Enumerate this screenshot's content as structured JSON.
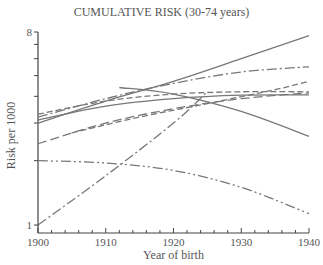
{
  "chart_data": {
    "type": "line",
    "title": "CUMULATIVE RISK (30-74 years)",
    "xlabel": "Year of birth",
    "ylabel": "Risk per 1000",
    "xlim": [
      1900,
      1940
    ],
    "ylim": [
      1,
      8
    ],
    "yscale": "log",
    "x_ticks": [
      1900,
      1910,
      1920,
      1930,
      1940
    ],
    "y_tick_labels": [
      "1",
      "8"
    ],
    "grid": false,
    "legend": "none",
    "series": [
      {
        "name": "solid-rising-top",
        "style": "solid",
        "x": [
          1900,
          1910,
          1920,
          1930,
          1940
        ],
        "values": [
          3.0,
          3.8,
          4.7,
          6.0,
          7.7
        ]
      },
      {
        "name": "dashdot-rising",
        "style": "dashdot",
        "x": [
          1900,
          1910,
          1920,
          1930,
          1940
        ],
        "values": [
          3.2,
          3.9,
          4.6,
          5.2,
          5.5
        ]
      },
      {
        "name": "dashed-rising",
        "style": "dashed",
        "x": [
          1905,
          1915,
          1925,
          1935,
          1940
        ],
        "values": [
          2.7,
          3.2,
          3.7,
          4.3,
          4.7
        ]
      },
      {
        "name": "long-dashed-rising",
        "style": "longdash",
        "x": [
          1900,
          1910,
          1920,
          1930,
          1940
        ],
        "values": [
          2.4,
          3.0,
          3.5,
          3.9,
          4.15
        ]
      },
      {
        "name": "solid-curve-flat",
        "style": "solid",
        "x": [
          1900,
          1910,
          1920,
          1930,
          1940
        ],
        "values": [
          3.1,
          3.6,
          3.9,
          4.05,
          4.06
        ]
      },
      {
        "name": "dashed-cluster",
        "style": "dashed",
        "x": [
          1900,
          1910,
          1920,
          1930,
          1940
        ],
        "values": [
          3.3,
          3.8,
          4.1,
          4.2,
          4.2
        ]
      },
      {
        "name": "solid-falling",
        "style": "solid",
        "x": [
          1912,
          1920,
          1930,
          1940
        ],
        "values": [
          4.4,
          4.1,
          3.4,
          2.6
        ]
      },
      {
        "name": "dashdotdot-falling",
        "style": "dashdotdot",
        "x": [
          1900,
          1910,
          1920,
          1930,
          1940
        ],
        "values": [
          2.0,
          1.95,
          1.8,
          1.5,
          1.13
        ]
      },
      {
        "name": "dashdot-steep",
        "style": "dashdot",
        "x": [
          1900,
          1910,
          1920,
          1925
        ],
        "values": [
          1.0,
          1.7,
          3.0,
          4.2
        ]
      }
    ]
  }
}
